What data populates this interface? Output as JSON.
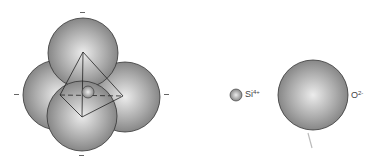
{
  "diagram": {
    "tetrahedron": {
      "charge_marks": [
        "-",
        "-",
        "-",
        "-"
      ]
    },
    "legend": {
      "silicon": {
        "symbol": "Si",
        "charge": "4+"
      },
      "oxygen": {
        "symbol": "O",
        "charge": "2-"
      }
    },
    "colors": {
      "sphere_light": "#e6e6e6",
      "sphere_dark": "#7a7a7a",
      "outline": "#333333"
    }
  }
}
